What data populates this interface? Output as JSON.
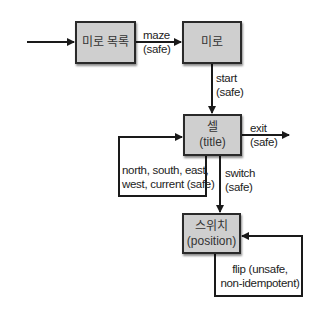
{
  "diagram": {
    "type": "state-transition",
    "colors": {
      "box_fill": "#cfcfcf",
      "box_border": "#2a2a2a",
      "line": "#1a1a1a",
      "background": "#ffffff"
    },
    "nodes": [
      {
        "id": "maze-list",
        "label": "미로 목록",
        "sublabel": ""
      },
      {
        "id": "maze",
        "label": "미로",
        "sublabel": ""
      },
      {
        "id": "cell",
        "label": "셀",
        "sublabel": "(title)"
      },
      {
        "id": "switch",
        "label": "스위치",
        "sublabel": "(position)"
      }
    ],
    "edges": [
      {
        "from": "entry",
        "to": "maze-list",
        "line1": "",
        "line2": ""
      },
      {
        "from": "maze-list",
        "to": "maze",
        "line1": "maze",
        "line2": "(safe)"
      },
      {
        "from": "maze",
        "to": "cell",
        "line1": "start",
        "line2": "(safe)"
      },
      {
        "from": "cell",
        "to": "exit",
        "line1": "exit",
        "line2": "(safe)"
      },
      {
        "from": "cell",
        "to": "cell",
        "line1": "north, south, east,",
        "line2": "west, current (safe)"
      },
      {
        "from": "cell",
        "to": "switch",
        "line1": "switch",
        "line2": "(safe)"
      },
      {
        "from": "switch",
        "to": "switch",
        "line1": "flip (unsafe,",
        "line2": "non-idempotent)"
      }
    ]
  }
}
